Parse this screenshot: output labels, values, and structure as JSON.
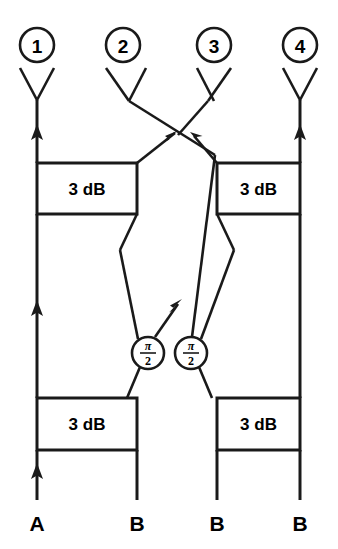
{
  "diagram": {
    "type": "schematic",
    "ink_color": "#1a1a1a",
    "background_color": "#ffffff",
    "antenna_ports": [
      {
        "id": "1",
        "label": "1",
        "x": 37,
        "circle_cy": 45
      },
      {
        "id": "2",
        "label": "2",
        "x": 123,
        "circle_cy": 45
      },
      {
        "id": "3",
        "label": "3",
        "x": 214,
        "circle_cy": 45
      },
      {
        "id": "4",
        "label": "4",
        "x": 300,
        "circle_cy": 45
      }
    ],
    "couplers": [
      {
        "id": "coupler-top-left",
        "label": "3 dB",
        "x": 37,
        "y": 163,
        "w": 100,
        "h": 51
      },
      {
        "id": "coupler-top-right",
        "label": "3 dB",
        "x": 217,
        "y": 163,
        "w": 83,
        "h": 51
      },
      {
        "id": "coupler-bottom-left",
        "label": "3 dB",
        "x": 37,
        "y": 398,
        "w": 100,
        "h": 52
      },
      {
        "id": "coupler-bottom-right",
        "label": "3 dB",
        "x": 217,
        "y": 398,
        "w": 83,
        "h": 52
      }
    ],
    "phase_shifters": [
      {
        "id": "phase-shifter-left",
        "numerator": "π",
        "denominator": "2",
        "cx": 148,
        "cy": 353,
        "r": 16
      },
      {
        "id": "phase-shifter-right",
        "numerator": "π",
        "denominator": "2",
        "cx": 191,
        "cy": 353,
        "r": 16
      }
    ],
    "input_ports": [
      {
        "id": "input-a",
        "label": "A",
        "x": 37,
        "y": 521,
        "has_arrow": true
      },
      {
        "id": "input-b1",
        "label": "B",
        "x": 137,
        "y": 521,
        "has_arrow": false
      },
      {
        "id": "input-b2",
        "label": "B",
        "x": 217,
        "y": 521,
        "has_arrow": false
      },
      {
        "id": "input-b3",
        "label": "B",
        "x": 300,
        "y": 521,
        "has_arrow": false
      }
    ]
  }
}
